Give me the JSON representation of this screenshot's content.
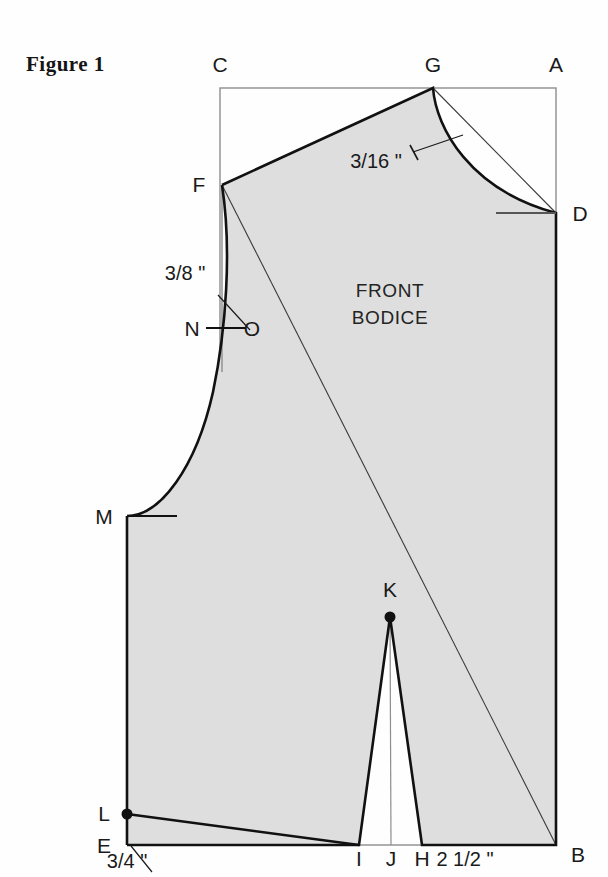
{
  "figure": {
    "title": "Figure 1",
    "piece_name_line1": "FRONT",
    "piece_name_line2": "BODICE"
  },
  "colors": {
    "fill": "#dedede",
    "outline": "#111111",
    "construction": "#3a3a3a",
    "frame": "#8d8d8d",
    "text": "#1a1a1a",
    "background": "#fefefe"
  },
  "vertices": [
    {
      "id": "A",
      "label": "A",
      "x": 556,
      "y": 88,
      "label_x": 556,
      "label_y": 72,
      "marker": "none"
    },
    {
      "id": "B",
      "label": "B",
      "x": 556,
      "y": 845,
      "label_x": 578,
      "label_y": 862,
      "marker": "none"
    },
    {
      "id": "C",
      "label": "C",
      "x": 220,
      "y": 88,
      "label_x": 220,
      "label_y": 72,
      "marker": "none"
    },
    {
      "id": "D",
      "label": "D",
      "x": 556,
      "y": 213,
      "label_x": 580,
      "label_y": 221,
      "marker": "none"
    },
    {
      "id": "E",
      "label": "E",
      "x": 127,
      "y": 845,
      "label_x": 104,
      "label_y": 853,
      "marker": "none"
    },
    {
      "id": "F",
      "label": "F",
      "x": 222,
      "y": 185,
      "label_x": 199,
      "label_y": 192,
      "marker": "none"
    },
    {
      "id": "G",
      "label": "G",
      "x": 433,
      "y": 88,
      "label_x": 433,
      "label_y": 72,
      "marker": "none"
    },
    {
      "id": "H",
      "label": "H",
      "x": 422,
      "y": 845,
      "label_x": 422,
      "label_y": 866,
      "marker": "none"
    },
    {
      "id": "I",
      "label": "I",
      "x": 359,
      "y": 845,
      "label_x": 359,
      "label_y": 866,
      "marker": "none"
    },
    {
      "id": "J",
      "label": "J",
      "x": 391,
      "y": 845,
      "label_x": 391,
      "label_y": 866,
      "marker": "none"
    },
    {
      "id": "K",
      "label": "K",
      "x": 390,
      "y": 617,
      "label_x": 390,
      "label_y": 597,
      "marker": "dot"
    },
    {
      "id": "L",
      "label": "L",
      "x": 127,
      "y": 814,
      "label_x": 104,
      "label_y": 821,
      "marker": "dot"
    },
    {
      "id": "M",
      "label": "M",
      "x": 127,
      "y": 516,
      "label_x": 104,
      "label_y": 524,
      "marker": "none"
    },
    {
      "id": "N",
      "label": "N",
      "x": 206,
      "y": 328,
      "label_x": 192,
      "label_y": 336,
      "marker": "none"
    },
    {
      "id": "O",
      "label": "O",
      "x": 246,
      "y": 328,
      "label_x": 252,
      "label_y": 336,
      "marker": "none"
    }
  ],
  "dimensions": [
    {
      "id": "shoulder-ease",
      "text": "3/16 \"",
      "x": 376,
      "y": 168
    },
    {
      "id": "armhole-offset",
      "text": "3/8 \"",
      "x": 185,
      "y": 280
    },
    {
      "id": "hem-rise",
      "text": "3/4 \"",
      "x": 127,
      "y": 868
    },
    {
      "id": "dart-to-side",
      "text": "2 1/2 \"",
      "x": 465,
      "y": 866
    }
  ],
  "geometry": {
    "frame_rect": {
      "x": 220,
      "y": 88,
      "width": 336,
      "height": 757
    },
    "body_path": "M 222 185 L 433 88 C 436 128 470 190 556 213 L 556 845 L 422 845 L 390 617 L 359 845 L 127 845 L 127 814 L 127 516 C 160 516 196 468 213 392 C 226 330 232 250 222 185 Z",
    "outline_path": "M 222 185 L 433 88 C 436 128 470 190 556 213 L 556 845 L 422 845 L 390 617 L 359 845 L 127 845",
    "neckline_curve": "M 433 88 C 436 128 470 190 556 213",
    "armhole_curve": "M 222 185 C 232 250 226 330 213 392 C 196 468 160 516 127 516",
    "hem_line": "M 127 814 L 359 845",
    "left_edge": "M 127 516 L 127 845",
    "dart_left_leg": "M 390 617 L 359 845",
    "dart_right_leg": "M 390 617 L 422 845",
    "dart_center_line": "M 390 617 L 391 845",
    "construction_F_to_B": "M 222 185 L 556 845",
    "construction_G_to_D": "M 433 88 L 556 213",
    "construction_vertical_F": "M 222 185 L 222 372",
    "tick_N_O": "M 206 328 L 246 328",
    "tick_M": "M 127 516 L 177 516",
    "tick_D": "M 496 213 L 556 213",
    "leader_neck": "M 413 152 L 463 135",
    "leader_armhole": "M 218 295 L 250 330",
    "leader_hem": "M 131 846 L 152 872"
  }
}
